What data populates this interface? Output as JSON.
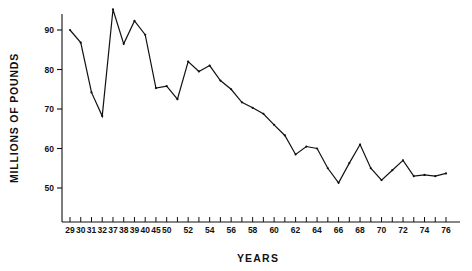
{
  "chart_data": {
    "type": "line",
    "title": "",
    "subtitle": "",
    "xlabel": "YEARS",
    "ylabel": "MILLIONS OF POUNDS",
    "xlim": [
      1929,
      1976
    ],
    "ylim": [
      44,
      96
    ],
    "grid": false,
    "legend": null,
    "yticks": [
      50,
      60,
      70,
      80,
      90
    ],
    "ytick_labels": [
      "50",
      "60",
      "70",
      "80",
      "90"
    ],
    "xtick_labels": [
      "29",
      "30",
      "31",
      "32",
      "37",
      "38",
      "39",
      "40",
      "45",
      "50",
      "52",
      "54",
      "56",
      "58",
      "60",
      "62",
      "64",
      "66",
      "68",
      "70",
      "72",
      "74",
      "76"
    ],
    "xtick_values": [
      29,
      30,
      31,
      32,
      37,
      38,
      39,
      40,
      45,
      50,
      52,
      54,
      56,
      58,
      60,
      62,
      64,
      66,
      68,
      70,
      72,
      74,
      76
    ],
    "minor_xticks": [
      51,
      53,
      55,
      57,
      59,
      61,
      63,
      65,
      67,
      69,
      71,
      73,
      75
    ],
    "line_color": "#111111",
    "line_width": 1.2,
    "marker": "dot",
    "x": [
      29,
      30,
      31,
      32,
      37,
      38,
      39,
      40,
      45,
      50,
      51,
      52,
      53,
      54,
      55,
      56,
      57,
      58,
      59,
      60,
      61,
      62,
      63,
      64,
      65,
      66,
      67,
      68,
      69,
      70,
      71,
      72,
      73,
      74,
      75,
      76
    ],
    "values": [
      90.0,
      86.8,
      74.2,
      68.2,
      95.2,
      86.5,
      92.3,
      88.8,
      75.3,
      75.8,
      72.5,
      82.0,
      79.5,
      81.0,
      77.2,
      75.0,
      71.7,
      70.3,
      68.8,
      66.0,
      63.3,
      58.5,
      60.5,
      60.0,
      55.0,
      51.3,
      56.3,
      61.0,
      55.0,
      52.0,
      54.5,
      57.0,
      53.0,
      53.3,
      53.0,
      53.7
    ],
    "series": [
      {
        "name": "",
        "values": [
          90.0,
          86.8,
          74.2,
          68.2,
          95.2,
          86.5,
          92.3,
          88.8,
          75.3,
          75.8,
          72.5,
          82.0,
          79.5,
          81.0,
          77.2,
          75.0,
          71.7,
          70.3,
          68.8,
          66.0,
          63.3,
          58.5,
          60.5,
          60.0,
          55.0,
          51.3,
          56.3,
          61.0,
          55.0,
          52.0,
          54.5,
          57.0,
          53.0,
          53.3,
          53.0,
          53.7
        ]
      }
    ]
  },
  "axes": {
    "y_axis_title": "MILLIONS OF POUNDS",
    "x_axis_title": "YEARS"
  }
}
